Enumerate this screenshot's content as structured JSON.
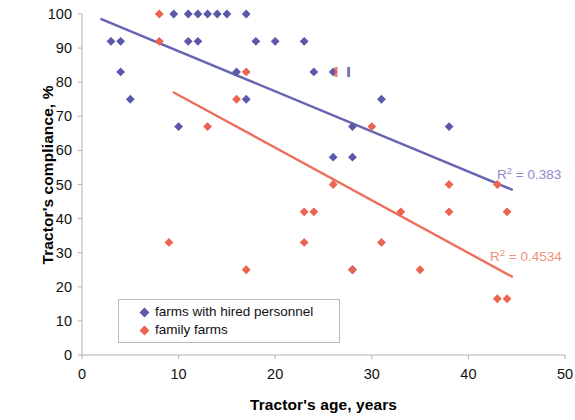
{
  "chart_data": {
    "type": "scatter",
    "title": "",
    "xlabel": "Tractor's age, years",
    "ylabel": "Tractor's compliance, %",
    "xlim": [
      0,
      50
    ],
    "ylim": [
      0,
      100
    ],
    "xticks": [
      0,
      10,
      20,
      30,
      40,
      50
    ],
    "yticks": [
      0,
      10,
      20,
      30,
      40,
      50,
      60,
      70,
      80,
      90,
      100
    ],
    "grid": false,
    "legend_position": "lower-left-inside",
    "series": [
      {
        "name": "farms with hired personnel",
        "color": "#5b57ab",
        "marker": "diamond",
        "points": [
          [
            3,
            92
          ],
          [
            4,
            92
          ],
          [
            4,
            83
          ],
          [
            5,
            75
          ],
          [
            10,
            67
          ],
          [
            11,
            92
          ],
          [
            12,
            92
          ],
          [
            9.5,
            100
          ],
          [
            11,
            100
          ],
          [
            12,
            100
          ],
          [
            13,
            100
          ],
          [
            14,
            100
          ],
          [
            15,
            100
          ],
          [
            17,
            100
          ],
          [
            16,
            83
          ],
          [
            17,
            75
          ],
          [
            18,
            92
          ],
          [
            20,
            92
          ],
          [
            23,
            92
          ],
          [
            24,
            83
          ],
          [
            26,
            83
          ],
          [
            26,
            58
          ],
          [
            28,
            58
          ],
          [
            28,
            67
          ],
          [
            28,
            25
          ],
          [
            31,
            75
          ],
          [
            38,
            67
          ]
        ],
        "trendline": {
          "x_start": 2.0,
          "y_start": 98.5,
          "x_end": 44.5,
          "y_end": 48.5,
          "r_squared": 0.383,
          "r2_label": "R2 = 0.383"
        }
      },
      {
        "name": "family farms",
        "color": "#ec6350",
        "marker": "diamond",
        "points": [
          [
            8,
            100
          ],
          [
            8,
            92
          ],
          [
            9,
            33
          ],
          [
            13,
            67
          ],
          [
            16,
            75
          ],
          [
            17,
            83
          ],
          [
            17,
            25
          ],
          [
            23,
            33
          ],
          [
            24,
            42
          ],
          [
            26,
            50
          ],
          [
            23,
            42
          ],
          [
            28,
            25
          ],
          [
            30,
            67
          ],
          [
            31,
            33
          ],
          [
            33,
            42
          ],
          [
            35,
            25
          ],
          [
            38,
            50
          ],
          [
            38,
            42
          ],
          [
            43,
            50
          ],
          [
            44,
            42
          ],
          [
            43,
            16.5
          ],
          [
            44,
            16.5
          ]
        ],
        "trendline": {
          "x_start": 9.5,
          "y_start": 77.0,
          "x_end": 44.5,
          "y_end": 23.0,
          "r_squared": 0.4534,
          "r2_label": "R2 = 0.4534"
        }
      }
    ],
    "annotations": [
      {
        "name": "small-red-tick",
        "x": 26.3,
        "y": 83,
        "color": "#ec6350"
      },
      {
        "name": "small-blue-tick",
        "x": 27.6,
        "y": 83,
        "color": "#5b57ab"
      }
    ]
  },
  "axes": {
    "y_title": "Tractor's compliance, %",
    "x_title": "Tractor's age, years",
    "y_tick_labels": [
      "100",
      "90",
      "80",
      "70",
      "60",
      "50",
      "40",
      "30",
      "20",
      "10",
      "0"
    ],
    "x_tick_labels": [
      "0",
      "10",
      "20",
      "30",
      "40",
      "50"
    ],
    "axis_color": "#b0b0b0"
  },
  "legend": {
    "items": [
      {
        "label": "farms with hired personnel",
        "color": "#5b57ab"
      },
      {
        "label": "family farms",
        "color": "#ec6350"
      }
    ]
  },
  "labels": {
    "r2_blue_prefix": "R",
    "r2_blue_sup": "2",
    "r2_blue_value": " = 0.383",
    "r2_red_prefix": "R",
    "r2_red_sup": "2",
    "r2_red_value": " = 0.4534"
  },
  "colors": {
    "blue": "#5b57ab",
    "red": "#ec6350",
    "axis": "#b0b0b0",
    "text": "#111111",
    "background": "#ffffff"
  }
}
